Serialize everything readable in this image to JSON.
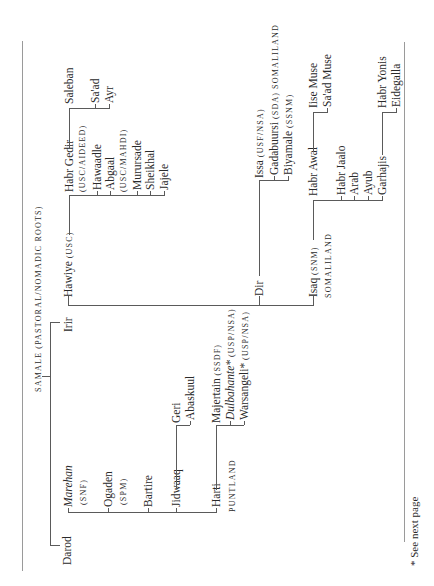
{
  "title": "samale (pastoral/nomadic roots)",
  "footnote": "*  See next page",
  "tree": {
    "root": "Samale",
    "darod": {
      "label": "Darod",
      "children": {
        "marehan": "Marehan",
        "marehan_party": "(snf)",
        "ogaden": "Ogaden",
        "ogaden_party": "(spm)",
        "bartire": "Bartire",
        "jidwaaq": "Jidwaaq",
        "harti": "Harti",
        "harti_region": "puntland"
      },
      "jidwaaq_children": [
        "Geri",
        "Abaskuul"
      ],
      "harti_children": [
        {
          "name": "Majertain",
          "party": "(ssdf)"
        },
        {
          "name": "Dulbahante*",
          "party": "(usp/nsa)"
        },
        {
          "name": "Warsangeli*",
          "party": "(usp/nsa)"
        }
      ]
    },
    "irir": {
      "label": "Irir",
      "hawiye": {
        "label": "Hawiye",
        "party": "(usc)",
        "children": [
          {
            "name": "Habr Gedir",
            "sub": "(usc/Aideed)"
          },
          {
            "name": "Hawaadle"
          },
          {
            "name": "Abgaal",
            "sub": "(usc/Mahdi)"
          },
          {
            "name": "Murursade"
          },
          {
            "name": "Sheikhal"
          },
          {
            "name": "Jajele"
          }
        ],
        "habr_gedir_children": [
          "Saleban",
          "Sa'ad",
          "Ayr"
        ]
      },
      "dir": {
        "label": "Dir",
        "children": [
          {
            "name": "Issa",
            "party": "(usf/nsa)"
          },
          {
            "name": "Gadabuursi",
            "party": "(sda)",
            "region": "somaliland"
          },
          {
            "name": "Biyamale",
            "party": "(ssnm)"
          }
        ]
      },
      "isaq": {
        "label": "Isaq",
        "party": "(snm)",
        "region": "somaliland",
        "children": [
          "Habr Awal",
          "Habr Jaalo",
          "Arab",
          "Ayub",
          "Garhajis"
        ],
        "habr_awal_children": [
          "Iise Muse",
          "Sa'ad Muse"
        ],
        "garhajis_children": [
          "Habr Yonis",
          "Eidegalla"
        ]
      }
    }
  }
}
